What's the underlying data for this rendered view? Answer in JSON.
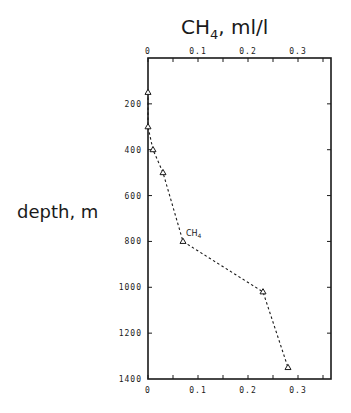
{
  "chart_data": {
    "type": "line",
    "title": "CH4, ml/l",
    "title_main": "CH",
    "title_sub": "4",
    "title_rest": ", ml/l",
    "xlabel": "CH4, ml/l",
    "ylabel": "depth, m",
    "x_axis_position": "top and bottom",
    "y_inverted": true,
    "xlim": [
      0,
      0.366
    ],
    "ylim": [
      0,
      1400
    ],
    "x_ticks": [
      0,
      0.1,
      0.2,
      0.3
    ],
    "x_tick_labels": [
      "0",
      "0.1",
      "0.2",
      "0.3"
    ],
    "x_minor_step": 0.05,
    "y_ticks": [
      200,
      400,
      600,
      800,
      1000,
      1200,
      1400
    ],
    "y_tick_labels": [
      "200",
      "400",
      "600",
      "800",
      "1000",
      "1200",
      "1400"
    ],
    "grid": false,
    "legend": "inline label next to curve",
    "series": [
      {
        "name": "CH4",
        "label_main": "CH",
        "label_sub": "4",
        "marker": "open-triangle",
        "line_style": "dashed",
        "points": [
          {
            "x": 0.0,
            "depth": 150
          },
          {
            "x": 0.0,
            "depth": 300
          },
          {
            "x": 0.01,
            "depth": 400
          },
          {
            "x": 0.03,
            "depth": 500
          },
          {
            "x": 0.07,
            "depth": 800
          },
          {
            "x": 0.23,
            "depth": 1020
          },
          {
            "x": 0.28,
            "depth": 1350
          }
        ]
      }
    ]
  },
  "colors": {
    "ink": "#1a1a1a",
    "background": "#ffffff"
  }
}
